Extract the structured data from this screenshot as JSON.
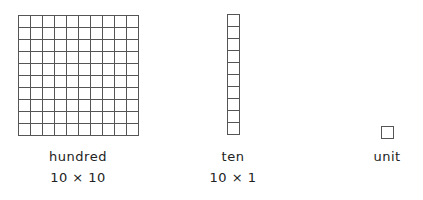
{
  "blocks": [
    {
      "id": "hundred",
      "name": "hundred",
      "dimensions": "10 × 10",
      "rows": 10,
      "cols": 10
    },
    {
      "id": "ten",
      "name": "ten",
      "dimensions": "10 × 1",
      "rows": 10,
      "cols": 1
    },
    {
      "id": "unit",
      "name": "unit",
      "dimensions": "",
      "rows": 1,
      "cols": 1
    }
  ],
  "colors": {
    "grid_line": "#555555",
    "background": "#ffffff",
    "text": "#222222"
  }
}
